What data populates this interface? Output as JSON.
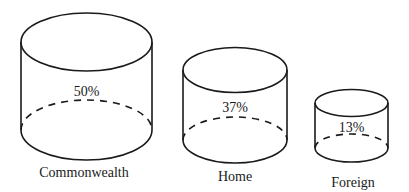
{
  "diagram": {
    "type": "cylinder-proportion-diagram",
    "cylinders": [
      {
        "name": "Commonwealth",
        "label": "Commonwealth",
        "value_label": "50%",
        "value": 50
      },
      {
        "name": "Home",
        "label": "Home",
        "value_label": "37%",
        "value": 37
      },
      {
        "name": "Foreign",
        "label": "Foreign",
        "value_label": "13%",
        "value": 13
      }
    ]
  },
  "colors": {
    "stroke": "#1a1a1a",
    "background": "#ffffff"
  }
}
